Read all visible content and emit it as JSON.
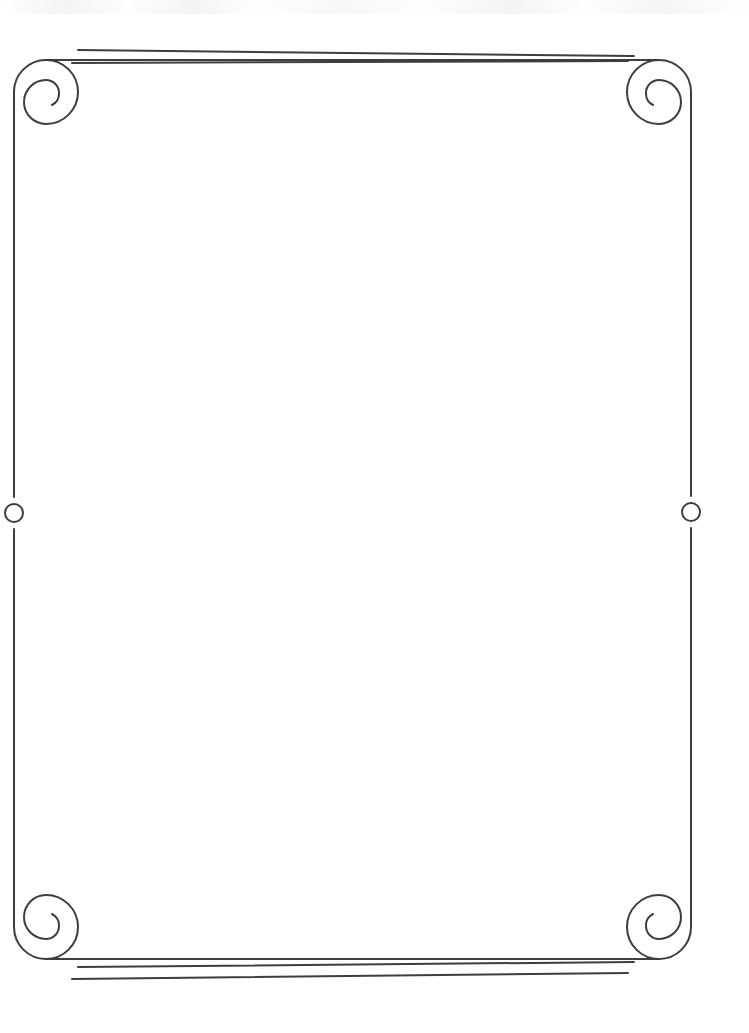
{
  "page": {
    "kind": "scanned-decorative-border-page",
    "width": 749,
    "height": 1033,
    "background_color": "#ffffff",
    "ink_color": "#3d3d42",
    "content_text": "",
    "content_note": "blank"
  },
  "frame": {
    "name": "ornamental-scroll-border",
    "stroke_color": "#3d3d42",
    "stroke_width": 2,
    "left_x": 14,
    "right_x": 691,
    "top_y": 60,
    "bottom_y": 959,
    "corner_radius": 32
  },
  "corners": [
    {
      "position": "top-left",
      "type": "spiral-scroll",
      "center_x": 46,
      "center_y": 92,
      "outer_radius": 32,
      "turns": 1.3,
      "direction": "clockwise-inward"
    },
    {
      "position": "top-right",
      "type": "spiral-scroll",
      "center_x": 659,
      "center_y": 92,
      "outer_radius": 32,
      "turns": 1.3,
      "direction": "counterclockwise-inward"
    },
    {
      "position": "bottom-left",
      "type": "spiral-scroll",
      "center_x": 46,
      "center_y": 927,
      "outer_radius": 32,
      "turns": 1.3,
      "direction": "counterclockwise-inward"
    },
    {
      "position": "bottom-right",
      "type": "spiral-scroll",
      "center_x": 659,
      "center_y": 927,
      "outer_radius": 32,
      "turns": 1.3,
      "direction": "clockwise-inward"
    }
  ],
  "accent_rules": [
    {
      "name": "top-outer-rule",
      "x1": 78,
      "y1": 50,
      "x2": 634,
      "y2": 56,
      "stroke_width": 2
    },
    {
      "name": "top-inner-rule",
      "x1": 72,
      "y1": 63,
      "x2": 628,
      "y2": 61,
      "stroke_width": 2
    },
    {
      "name": "bottom-inner-rule",
      "x1": 78,
      "y1": 967,
      "x2": 634,
      "y2": 962,
      "stroke_width": 2
    },
    {
      "name": "bottom-outer-rule",
      "x1": 72,
      "y1": 979,
      "x2": 628,
      "y2": 973,
      "stroke_width": 2
    }
  ],
  "side_medallions": [
    {
      "name": "left-circle-medallion",
      "center_x": 14,
      "center_y": 513,
      "radius": 9,
      "gap_half_height": 16
    },
    {
      "name": "right-circle-medallion",
      "center_x": 691,
      "center_y": 512,
      "radius": 9,
      "gap_half_height": 16
    }
  ]
}
